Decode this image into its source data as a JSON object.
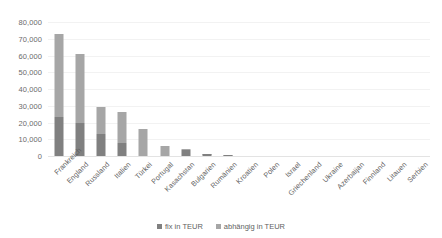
{
  "chart_data": {
    "type": "bar",
    "subtype": "stacked-bar",
    "title": "",
    "xlabel": "",
    "ylabel": "",
    "ylim": [
      0,
      80000
    ],
    "ytick_values": [
      0,
      10000,
      20000,
      30000,
      40000,
      50000,
      60000,
      70000,
      80000
    ],
    "ytick_labels": [
      "0",
      "10,000",
      "20,000",
      "30,000",
      "40,000",
      "50,000",
      "60,000",
      "70,000",
      "80,000"
    ],
    "grid": true,
    "grid_axis": "y",
    "legend_position": "bottom",
    "categories": [
      "Frankreich",
      "England",
      "Russland",
      "Italien",
      "Türkei",
      "Portugal",
      "Kasachstan",
      "Bulgarien",
      "Rumänien",
      "Kroatien",
      "Polen",
      "Israel",
      "Griechenland",
      "Ukraine",
      "Azerbaijan",
      "Finnland",
      "Litauen",
      "Serbien"
    ],
    "series": [
      {
        "name": "fix in TEUR",
        "color": "#808080",
        "values": [
          23000,
          20000,
          13000,
          7500,
          0,
          0,
          3500,
          1200,
          400,
          0,
          0,
          0,
          0,
          0,
          0,
          0,
          0,
          0
        ]
      },
      {
        "name": "abhängig in TEUR",
        "color": "#a6a6a6",
        "values": [
          50000,
          41000,
          16000,
          18500,
          16000,
          6000,
          500,
          300,
          200,
          0,
          0,
          0,
          0,
          0,
          0,
          0,
          0,
          0
        ]
      }
    ],
    "totals": [
      73000,
      61000,
      29000,
      26000,
      16000,
      6000,
      4000,
      1500,
      600,
      0,
      0,
      0,
      0,
      0,
      0,
      0,
      0,
      0
    ]
  },
  "legend": {
    "items": [
      {
        "label": "fix in TEUR",
        "color": "#808080"
      },
      {
        "label": "abhängig in TEUR",
        "color": "#a6a6a6"
      }
    ]
  },
  "colors": {
    "series_fix": "#808080",
    "series_dependent": "#a6a6a6",
    "gridline": "#f2f2f2",
    "axis_text": "#6b6b6b",
    "background": "#ffffff"
  }
}
